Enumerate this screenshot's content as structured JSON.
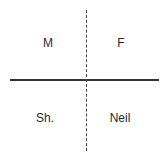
{
  "diagram": {
    "quadrants": [
      {
        "position": "top-left",
        "label": "M",
        "x": 48,
        "y": 43
      },
      {
        "position": "top-right",
        "label": "F",
        "x": 121,
        "y": 43
      },
      {
        "position": "bottom-left",
        "label": "Sh.",
        "x": 45,
        "y": 118
      },
      {
        "position": "bottom-right",
        "label": "Neil",
        "x": 120,
        "y": 118
      }
    ],
    "axes": {
      "horizontal": "solid",
      "vertical": "dashed"
    }
  }
}
